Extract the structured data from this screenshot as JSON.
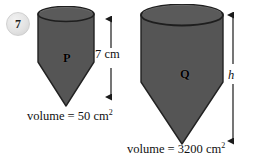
{
  "question": {
    "number": "7"
  },
  "shapes": [
    {
      "id": "P",
      "letter": "P",
      "fill_color": "#555555",
      "stroke_color": "#222222",
      "volume_caption": "volume = 50 cm",
      "volume_unit_exponent": "2",
      "volume_value": 50,
      "volume_unit": "cm2"
    },
    {
      "id": "Q",
      "letter": "Q",
      "fill_color": "#555555",
      "stroke_color": "#222222",
      "volume_caption": "volume = 3200 cm",
      "volume_unit_exponent": "2",
      "volume_value": 3200,
      "volume_unit": "cm2"
    }
  ],
  "dimensions": [
    {
      "id": "height-p",
      "label": "7 cm",
      "value": "7",
      "unit": "cm",
      "belongs_to": "P",
      "arrow": "double-headed-vertical"
    },
    {
      "id": "height-q",
      "label": "h",
      "value": "h",
      "unit": "",
      "belongs_to": "Q",
      "arrow": "double-headed-vertical"
    }
  ],
  "colors": {
    "background": "#ffffff",
    "solid_fill": "#555555",
    "solid_outline": "#222222",
    "badge_fill": "#e3e3e3",
    "text": "#111111",
    "arrow": "#1a1a1a"
  }
}
